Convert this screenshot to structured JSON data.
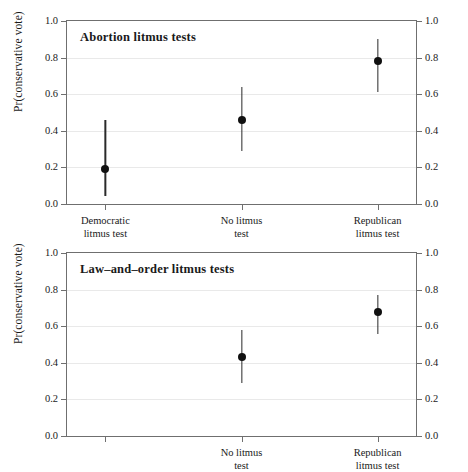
{
  "chart_data": [
    {
      "type": "scatter",
      "title": "Abortion litmus tests",
      "xlabel": "",
      "ylabel": "Pr(conservative vote)",
      "ylim": [
        0.0,
        1.0
      ],
      "yticks": [
        "0.0",
        "0.2",
        "0.4",
        "0.6",
        "0.8",
        "1.0"
      ],
      "ytick_values": [
        0.0,
        0.2,
        0.4,
        0.6,
        0.8,
        1.0
      ],
      "grid": true,
      "legend": "none",
      "dual_y_axis": true,
      "categories": [
        "Democratic litmus test",
        "No litmus test",
        "Republican litmus test"
      ],
      "category_lines": [
        [
          "Democratic",
          "litmus test"
        ],
        [
          "No litmus",
          "test"
        ],
        [
          "Republican",
          "litmus test"
        ]
      ],
      "values": [
        0.19,
        0.46,
        0.78
      ],
      "ci_low": [
        0.045,
        0.29,
        0.61
      ],
      "ci_high": [
        0.46,
        0.64,
        0.9
      ],
      "x_positions": [
        0.11,
        0.5,
        0.89
      ]
    },
    {
      "type": "scatter",
      "title": "Law-and-order litmus tests",
      "xlabel": "",
      "ylabel": "Pr(conservative vote)",
      "ylim": [
        0.0,
        1.0
      ],
      "yticks": [
        "0.0",
        "0.2",
        "0.4",
        "0.6",
        "0.8",
        "1.0"
      ],
      "ytick_values": [
        0.0,
        0.2,
        0.4,
        0.6,
        0.8,
        1.0
      ],
      "grid": true,
      "legend": "none",
      "dual_y_axis": true,
      "categories": [
        "",
        "No litmus test",
        "Republican litmus test"
      ],
      "category_lines": [
        [
          "",
          ""
        ],
        [
          "No litmus",
          "test"
        ],
        [
          "Republican",
          "litmus test"
        ]
      ],
      "values": [
        null,
        0.43,
        0.68
      ],
      "ci_low": [
        null,
        0.29,
        0.56
      ],
      "ci_high": [
        null,
        0.58,
        0.77
      ],
      "x_positions": [
        0.11,
        0.5,
        0.89
      ]
    }
  ],
  "panels": {
    "top": {
      "title": "Abortion litmus tests",
      "axis_title": "Pr(conservative vote)",
      "yticks": [
        "0.0",
        "0.2",
        "0.4",
        "0.6",
        "0.8",
        "1.0"
      ],
      "xlabels": [
        {
          "line1": "Democratic",
          "line2": "litmus test"
        },
        {
          "line1": "No litmus",
          "line2": "test"
        },
        {
          "line1": "Republican",
          "line2": "litmus test"
        }
      ]
    },
    "bottom": {
      "title": "Law–and–order litmus tests",
      "axis_title": "Pr(conservative vote)",
      "yticks": [
        "0.0",
        "0.2",
        "0.4",
        "0.6",
        "0.8",
        "1.0"
      ],
      "xlabels": [
        {
          "line1": "",
          "line2": ""
        },
        {
          "line1": "No litmus",
          "line2": "test"
        },
        {
          "line1": "Republican",
          "line2": "litmus test"
        }
      ]
    }
  },
  "colors": {
    "point": "#101010",
    "errorbar": "#2a2a2a",
    "frame": "#6f6f6f",
    "grid": "#e9e9e9",
    "text": "#1a1a1a",
    "background": "#ffffff"
  }
}
